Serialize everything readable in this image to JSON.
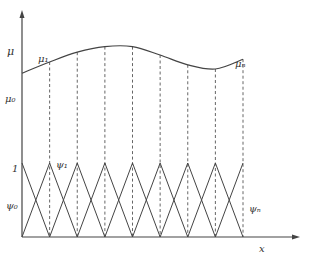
{
  "diagram": {
    "axes": {
      "y_label": "μ",
      "x_label": "x"
    },
    "curve_labels": {
      "start": "μ₀",
      "first": "μ₁",
      "last": "μₙ"
    },
    "basis_labels": {
      "unit_level": "1",
      "first": "ψ₀",
      "second": "ψ₁",
      "last": "ψₙ"
    },
    "node_count": 9,
    "curve_values": [
      0.62,
      0.7,
      0.77,
      0.81,
      0.81,
      0.75,
      0.68,
      0.65,
      0.72
    ],
    "basis_peak": 1
  }
}
